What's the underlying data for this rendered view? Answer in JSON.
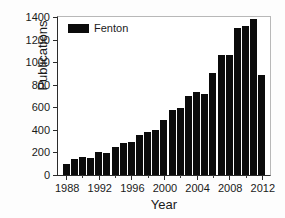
{
  "chart_data": {
    "type": "bar",
    "title": "",
    "xlabel": "Year",
    "ylabel": "Publications",
    "xlim": [
      1987,
      2013
    ],
    "ylim": [
      0,
      1400
    ],
    "ytick_labels": [
      "0",
      "200",
      "400",
      "600",
      "800",
      "1000",
      "1200",
      "1400"
    ],
    "ytick_values": [
      0,
      200,
      400,
      600,
      800,
      1000,
      1200,
      1400
    ],
    "xtick_labels": [
      "1988",
      "1992",
      "1996",
      "2000",
      "2004",
      "2008",
      "2012"
    ],
    "xtick_values": [
      1988,
      1992,
      1996,
      2000,
      2004,
      2008,
      2012
    ],
    "grid": false,
    "legend": {
      "position": "top-left",
      "entries": [
        {
          "name": "Fenton",
          "color": "#0b0b0b"
        }
      ]
    },
    "series": [
      {
        "name": "Fenton",
        "color": "#0b0b0b",
        "categories": [
          1988,
          1989,
          1990,
          1991,
          1992,
          1993,
          1994,
          1995,
          1996,
          1997,
          1998,
          1999,
          2000,
          2001,
          2002,
          2003,
          2004,
          2005,
          2006,
          2007,
          2008,
          2009,
          2010,
          2011,
          2012
        ],
        "values": [
          95,
          140,
          160,
          152,
          207,
          192,
          248,
          280,
          290,
          355,
          385,
          400,
          485,
          575,
          595,
          700,
          735,
          720,
          900,
          1060,
          1060,
          1305,
          1320,
          1380,
          890
        ]
      }
    ]
  },
  "axis": {
    "ylabel_text": "Publications",
    "xlabel_text": "Year"
  },
  "legend": {
    "label": "Fenton"
  }
}
